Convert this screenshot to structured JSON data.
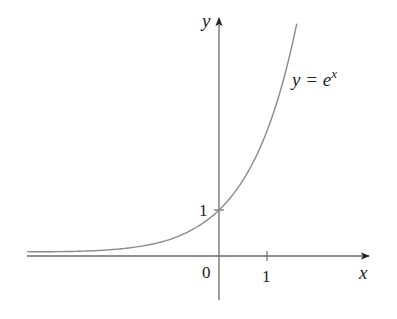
{
  "chart_data": {
    "type": "line",
    "title": "",
    "function": "y = e^x",
    "series": [
      {
        "name": "y = e^x",
        "label_text": "y = e",
        "label_sup": "x",
        "x": [
          -4,
          -3,
          -2,
          -1,
          -0.5,
          0,
          0.5,
          1,
          1.25,
          1.5,
          1.62
        ],
        "values": [
          0.018,
          0.05,
          0.135,
          0.368,
          0.607,
          1,
          1.649,
          2.718,
          3.49,
          4.482,
          5.053
        ]
      }
    ],
    "xlabel": "x",
    "ylabel": "y",
    "x_ticks": [
      {
        "value": 1,
        "label": "1"
      }
    ],
    "y_ticks": [
      {
        "value": 1,
        "label": "1"
      }
    ],
    "origin_label": "0",
    "xlim": [
      -4,
      3.2
    ],
    "ylim": [
      -1,
      5.2
    ],
    "grid": false,
    "legend": "none",
    "colors": {
      "axes": "#6b6b6b",
      "curve": "#8a8a8a",
      "text": "#222222"
    }
  }
}
